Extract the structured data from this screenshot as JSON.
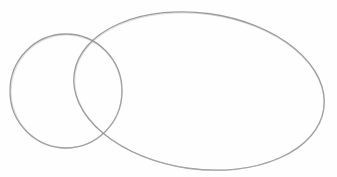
{
  "image": {
    "description": "Pencil sketch of two overlapping ellipses on white paper",
    "background": "#fefefe",
    "stroke_color": "#8a8a8a",
    "shapes": [
      {
        "name": "small-circle",
        "cx": 66,
        "cy": 91,
        "rx": 56,
        "ry": 57,
        "rotate": 0
      },
      {
        "name": "large-ellipse",
        "cx": 199,
        "cy": 91,
        "rx": 126,
        "ry": 78,
        "rotate": 8
      }
    ]
  }
}
